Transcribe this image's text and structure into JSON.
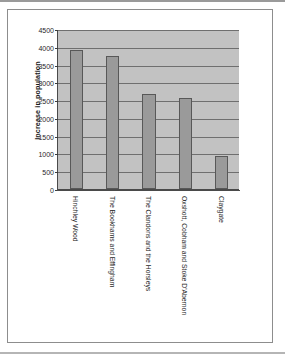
{
  "figure": {
    "border_color": "#8d8d8d",
    "background": "#ffffff"
  },
  "chart_data": {
    "type": "bar",
    "title": "",
    "xlabel": "",
    "ylabel": "Increase in population",
    "categories": [
      "Hinchley Wood",
      "The Bookhams and Effingham",
      "The Clandons and the Horsleys",
      "Oxshott, Cobham and Stoke D'Abernon",
      "Claygate"
    ],
    "values": [
      3900,
      3750,
      2680,
      2570,
      930
    ],
    "ylim": [
      0,
      4500
    ],
    "ytick_labels": [
      "0",
      "500",
      "1000",
      "1500",
      "2000",
      "2500",
      "3000",
      "3500",
      "4000",
      "4500"
    ],
    "ytick_values": [
      0,
      500,
      1000,
      1500,
      2000,
      2500,
      3000,
      3500,
      4000,
      4500
    ],
    "grid": true,
    "legend": "none",
    "series": [
      {
        "name": "Increase in population",
        "values": [
          3900,
          3750,
          2680,
          2570,
          930
        ],
        "color": "#9a9a9a"
      }
    ],
    "plot_background": "#c2c2c2",
    "bar_color": "#9a9a9a",
    "bar_border_color": "#585858",
    "gridline_color": "#6f6f6f",
    "axis_color": "#4a4a4a"
  }
}
